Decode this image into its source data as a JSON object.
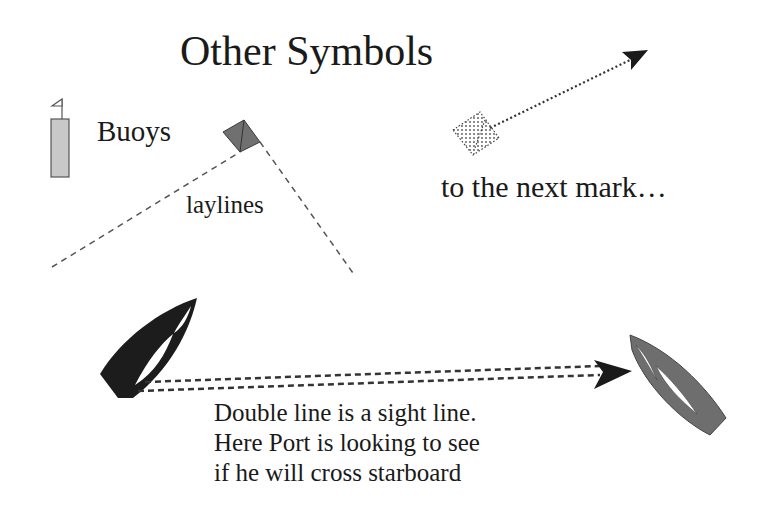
{
  "title": "Other Symbols",
  "labels": {
    "buoys": "Buoys",
    "laylines": "laylines",
    "next_mark": "to the next mark…"
  },
  "caption": {
    "lines": [
      "Double line is a sight line.",
      "Here Port is looking to see",
      "if he will cross starboard"
    ]
  },
  "symbols": {
    "buoy": {
      "icon": "buoy-icon",
      "fill": "#c8c8c8",
      "stroke": "#555555"
    },
    "mark": {
      "icon": "mark-diamond-icon",
      "fill": "#707070",
      "stroke": "#3a3a3a"
    },
    "next_mark": {
      "icon": "dotted-mark-icon",
      "style": "dotted"
    },
    "port_boat": {
      "icon": "port-boat-icon",
      "fill": "#1c1c1c"
    },
    "starboard_boat": {
      "icon": "starboard-boat-icon",
      "fill": "#6e6e6e"
    },
    "layline_style": "dashed",
    "sight_line_style": "double-dashed",
    "next_arrow_style": "dotted"
  }
}
